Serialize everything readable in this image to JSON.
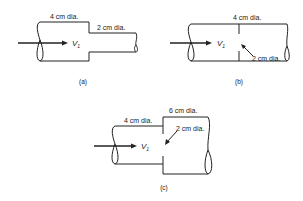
{
  "figures": [
    {
      "id": "a",
      "caption": "(a)",
      "description": "Sudden contraction from larger pipe to smaller pipe",
      "labels": {
        "upstream_diameter": "4 cm dia.",
        "downstream_diameter": "2 cm dia."
      },
      "velocity": {
        "symbol": "V",
        "subscript": "1"
      }
    },
    {
      "id": "b",
      "caption": "(b)",
      "description": "Orifice plate in a uniform pipe",
      "labels": {
        "pipe_diameter": "4 cm dia.",
        "orifice_diameter": "2 cm dia."
      },
      "velocity": {
        "symbol": "V",
        "subscript": "1"
      }
    },
    {
      "id": "c",
      "caption": "(c)",
      "description": "Orifice at a sudden expansion from smaller pipe to larger pipe",
      "labels": {
        "upstream_diameter": "4 cm dia.",
        "downstream_diameter": "6 cm dia.",
        "orifice_diameter": "2 cm dia."
      },
      "velocity": {
        "symbol": "V",
        "subscript": "1"
      }
    }
  ]
}
